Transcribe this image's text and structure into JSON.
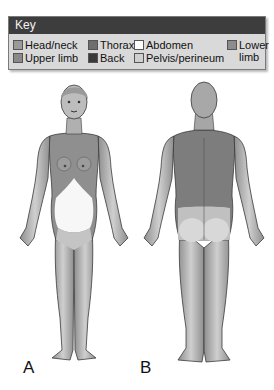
{
  "key": {
    "title": "Key",
    "items": [
      {
        "label": "Head/neck",
        "color": "#9a9a9a"
      },
      {
        "label": "Upper limb",
        "color": "#8a8a8a"
      },
      {
        "label": "Thorax",
        "color": "#6e6e6e"
      },
      {
        "label": "Back",
        "color": "#3a3a3a"
      },
      {
        "label": "Abdomen",
        "color": "#ffffff"
      },
      {
        "label": "Pelvis/perineum",
        "color": "#cfcfcf"
      },
      {
        "label": "Lower limb",
        "color": "#8c8c8c"
      }
    ],
    "lower_limb_line1": "Lower",
    "lower_limb_line2": "limb"
  },
  "figures": {
    "a": {
      "label": "A",
      "view": "anterior"
    },
    "b": {
      "label": "B",
      "view": "posterior"
    }
  },
  "colors": {
    "skin": "#b5b5b5",
    "thorax": "#8f8f8f",
    "abdomen": "#f7f7f7",
    "back": "#7d7d7d",
    "outline": "#3a3a3a"
  }
}
